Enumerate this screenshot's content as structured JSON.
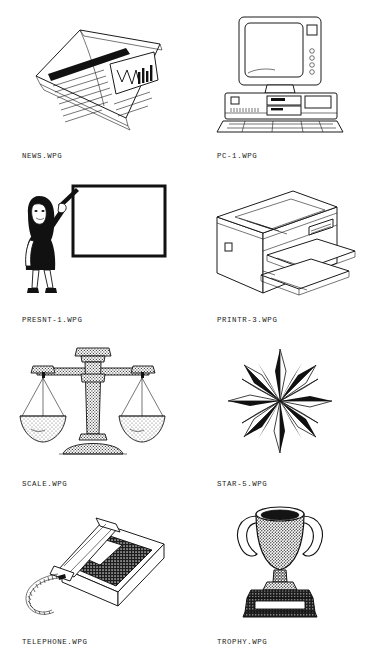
{
  "page": {
    "kind": "clip-art-catalog-sheet",
    "background_color": "#ffffff",
    "ink_color": "#1a1a1a",
    "columns": 2,
    "rows": 4
  },
  "items": [
    {
      "label": "NEWS.WPG",
      "icon_name": "newspaper-illustration",
      "subject": "folded newspaper with headline bar, text lines and an inset chart"
    },
    {
      "label": "PC-1.WPG",
      "icon_name": "desktop-computer-illustration",
      "subject": "desktop personal computer with monitor, system unit and keyboard"
    },
    {
      "label": "PRESNT-1.WPG",
      "icon_name": "presenter-illustration",
      "subject": "woman in black dress pointing with a pointer at a blank presentation board"
    },
    {
      "label": "PRINTR-3.WPG",
      "icon_name": "laser-printer-illustration",
      "subject": "laser printer in isometric view with paper output trays"
    },
    {
      "label": "SCALE.WPG",
      "icon_name": "balance-scale-illustration",
      "subject": "balance scale with two hanging pans on a stippled column and base"
    },
    {
      "label": "STAR-5.WPG",
      "icon_name": "compass-star-illustration",
      "subject": "twelve point faceted compass rose star in black and white"
    },
    {
      "label": "TELEPHONE.WPG",
      "icon_name": "desk-telephone-illustration",
      "subject": "desk telephone with coiled cord, handset and dark keypad panel"
    },
    {
      "label": "TROPHY.WPG",
      "icon_name": "trophy-cup-illustration",
      "subject": "two handled trophy cup with stippled bowl on a dark plinth with nameplate"
    }
  ]
}
